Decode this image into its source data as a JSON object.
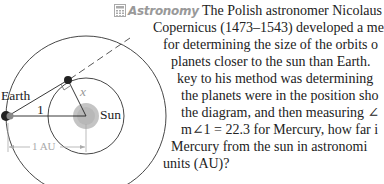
{
  "diagram": {
    "labels": {
      "earth": "Earth",
      "angle": "1",
      "side": "x",
      "sun": "Sun",
      "distance": "1 AU"
    },
    "colors": {
      "orbit": "#333333",
      "sun": "#bdbdbd",
      "planet": "#222222",
      "dimension": "#aaaaaa"
    }
  },
  "problem": {
    "tag_icon": "calculator-icon",
    "tag": "Astronomy",
    "lines": [
      "The Polish astronomer Nicolaus",
      "Copernicus (1473–1543) developed a me",
      "for determining the size of the orbits o",
      "planets closer to the sun than Earth.",
      "key to his method was determining",
      "the planets were in the position sho",
      "the diagram, and then measuring ∠",
      "m∠1 = 22.3 for Mercury, how far i",
      "Mercury from the sun in astronomi",
      "units (AU)?"
    ]
  }
}
